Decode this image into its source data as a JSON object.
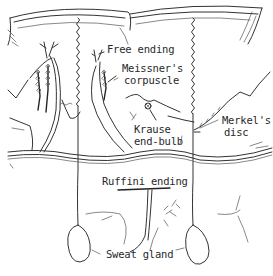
{
  "diagram": {
    "type": "anatomical-illustration",
    "labels": {
      "free_ending": "Free ending",
      "meissner_line1": "Meissner's",
      "meissner_line2": "corpuscle",
      "krause_line1": "Krause",
      "krause_line2": "end-bulb",
      "merkel_line1": "Merkel's",
      "merkel_line2": "disc",
      "ruffini": "Ruffini ending",
      "sweat_gland": "Sweat gland"
    },
    "layers": [
      "epidermis",
      "dermis",
      "subcutaneous"
    ],
    "ink_color": "#333333",
    "background_color": "#ffffff"
  }
}
